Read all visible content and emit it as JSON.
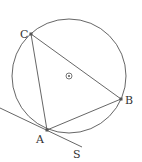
{
  "diagram": {
    "type": "geometry",
    "colors": {
      "stroke": "#555555",
      "point": "#555555",
      "label": "#333333"
    },
    "circle": {
      "cx": 69,
      "cy": 76,
      "r": 57
    },
    "center_mark": {
      "x": 69,
      "y": 76
    },
    "points": {
      "A": {
        "x": 47,
        "y": 130,
        "label": "A"
      },
      "B": {
        "x": 121,
        "y": 99,
        "label": "B"
      },
      "C": {
        "x": 31,
        "y": 34,
        "label": "C"
      }
    },
    "tangent": {
      "from": {
        "x": 0,
        "y": 108
      },
      "to": {
        "x": 82,
        "y": 147
      },
      "end_label": "S"
    },
    "labels": {
      "A": "A",
      "B": "B",
      "C": "C",
      "S": "S"
    }
  }
}
